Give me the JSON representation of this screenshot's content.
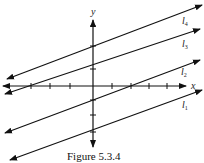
{
  "figure": {
    "caption": "Figure 5.3.4",
    "axes": {
      "x_label": "x",
      "y_label": "y"
    },
    "lines": [
      {
        "name": "l1",
        "label": "l",
        "subscript": "1"
      },
      {
        "name": "l2",
        "label": "l",
        "subscript": "2"
      },
      {
        "name": "l3",
        "label": "l",
        "subscript": "3"
      },
      {
        "name": "l4",
        "label": "l",
        "subscript": "4"
      }
    ],
    "colors": {
      "stroke": "#111111",
      "background": "#ffffff"
    }
  }
}
